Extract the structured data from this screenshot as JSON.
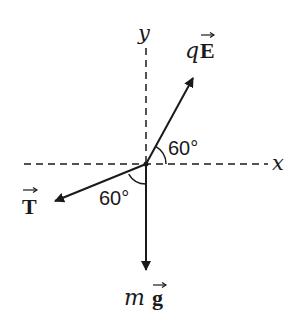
{
  "diagram": {
    "type": "free-body diagram",
    "axes": {
      "x_label": "x",
      "y_label": "y",
      "style": "dashed"
    },
    "forces": [
      {
        "id": "electric",
        "symbol_prefix": "q",
        "symbol_vector": "E",
        "label": "qE⃗",
        "direction_deg": 60,
        "angle_label": "60°",
        "angle_reference": "positive x-axis"
      },
      {
        "id": "tension",
        "symbol_prefix": "",
        "symbol_vector": "T",
        "label": "T⃗",
        "angle_label": "60°",
        "angle_reference": "negative y-axis"
      },
      {
        "id": "gravity",
        "symbol_prefix": "m",
        "symbol_vector": "g",
        "label": "mg⃗",
        "direction_deg": 270
      }
    ],
    "colors": {
      "ink": "#1a1a1a",
      "background": "#ffffff"
    }
  }
}
